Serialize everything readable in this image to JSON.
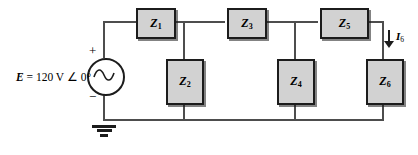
{
  "diagram": {
    "background_color": "#ffffff",
    "wire_color": "#4d4d4d",
    "box_fill_color": "#d2d2d2",
    "box_border_color": "#1c1c1c"
  },
  "source": {
    "label_e": "E",
    "label_equals": "=",
    "label_value": "120 V",
    "label_angle": "∠ 0°",
    "plus_sign": "+",
    "minus_sign": "−",
    "symbol": "ac-source-sine"
  },
  "impedances": [
    {
      "id": "z1",
      "label": "Z",
      "subscript": "1",
      "orientation": "horizontal"
    },
    {
      "id": "z2",
      "label": "Z",
      "subscript": "2",
      "orientation": "vertical"
    },
    {
      "id": "z3",
      "label": "Z",
      "subscript": "3",
      "orientation": "horizontal"
    },
    {
      "id": "z4",
      "label": "Z",
      "subscript": "4",
      "orientation": "vertical"
    },
    {
      "id": "z5",
      "label": "Z",
      "subscript": "5",
      "orientation": "horizontal"
    },
    {
      "id": "z6",
      "label": "Z",
      "subscript": "6",
      "orientation": "vertical"
    }
  ],
  "current": {
    "label": "I",
    "subscript": "6",
    "direction": "down"
  },
  "ground": {
    "symbol": "earth-ground"
  }
}
